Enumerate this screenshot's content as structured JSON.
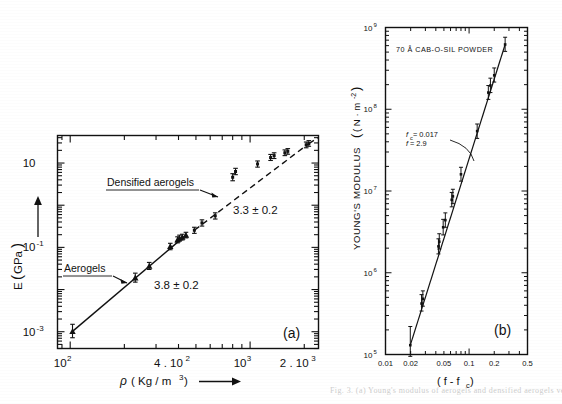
{
  "figure": {
    "background": "#ffffff",
    "ink": "#111111",
    "caption_fragment": "Fig. 3. (a) Young's modulus of aerogels and densified aerogels versus density; (b) Young's modulus of compacted"
  },
  "panel_a": {
    "tag": "(a)",
    "xlabel_parts": {
      "symbol": "ρ",
      "units": "( Kg / m",
      "exp": "3",
      "close": " )"
    },
    "xlabel_full": "ρ ( Kg / m³ )",
    "ylabel_parts": {
      "symbol": "E",
      "units": "( GPa )"
    },
    "ylabel_full": "E ( GPa )",
    "xticks": [
      {
        "value": 100,
        "label_mantissa": "10",
        "label_exp": "2"
      },
      {
        "value": 400,
        "label_mantissa": "4 . 10",
        "label_exp": "2"
      },
      {
        "value": 1000,
        "label_mantissa": "10",
        "label_exp": "3"
      },
      {
        "value": 2000,
        "label_mantissa": "2 . 10",
        "label_exp": "3"
      }
    ],
    "yticks": [
      {
        "value": 10,
        "label_mantissa": "10",
        "label_exp": ""
      },
      {
        "value": 0.1,
        "label_mantissa": "10",
        "label_exp": "-1"
      },
      {
        "value": 0.001,
        "label_mantissa": "10",
        "label_exp": "-3"
      }
    ],
    "annotations": [
      {
        "name": "aerogels-label",
        "text": "Aerogels",
        "underlined": true
      },
      {
        "name": "densified-label",
        "text": "Densified  aerogels",
        "underlined": true
      },
      {
        "name": "exponent-low",
        "text": "3.8 ± 0.2"
      },
      {
        "name": "exponent-high",
        "text": "3.3 ± 0.2"
      }
    ],
    "xlim": [
      85,
      2400
    ],
    "ylim": [
      0.0004,
      45
    ],
    "series": [
      {
        "name": "Aerogels",
        "marker": "filled-triangle",
        "line": "solid",
        "points": [
          {
            "x": 103,
            "y": 0.00102,
            "err_lo": 0.00072,
            "err_hi": 0.0015
          },
          {
            "x": 230,
            "y": 0.019,
            "err_lo": 0.015,
            "err_hi": 0.0245
          },
          {
            "x": 275,
            "y": 0.036,
            "err_lo": 0.03,
            "err_hi": 0.044
          },
          {
            "x": 360,
            "y": 0.105,
            "err_lo": 0.088,
            "err_hi": 0.125
          },
          {
            "x": 395,
            "y": 0.15,
            "err_lo": 0.128,
            "err_hi": 0.178
          },
          {
            "x": 405,
            "y": 0.165,
            "err_lo": 0.14,
            "err_hi": 0.195
          },
          {
            "x": 420,
            "y": 0.175,
            "err_lo": 0.15,
            "err_hi": 0.205
          },
          {
            "x": 440,
            "y": 0.195,
            "err_lo": 0.168,
            "err_hi": 0.228
          }
        ]
      },
      {
        "name": "Densified aerogels",
        "marker": "bar",
        "line": "dashed",
        "points": [
          {
            "x": 490,
            "y": 0.255,
            "err_lo": 0.215,
            "err_hi": 0.3
          },
          {
            "x": 540,
            "y": 0.38,
            "err_lo": 0.32,
            "err_hi": 0.45
          },
          {
            "x": 640,
            "y": 0.56,
            "err_lo": 0.47,
            "err_hi": 0.66
          },
          {
            "x": 800,
            "y": 4.6,
            "err_lo": 3.8,
            "err_hi": 5.6
          },
          {
            "x": 830,
            "y": 6.3,
            "err_lo": 5.3,
            "err_hi": 7.5
          },
          {
            "x": 1100,
            "y": 9.5,
            "err_lo": 8.0,
            "err_hi": 11.2
          },
          {
            "x": 1300,
            "y": 13.5,
            "err_lo": 11.5,
            "err_hi": 16.0
          },
          {
            "x": 1360,
            "y": 15.0,
            "err_lo": 12.8,
            "err_hi": 17.5
          },
          {
            "x": 1560,
            "y": 17.5,
            "err_lo": 15.0,
            "err_hi": 20.5
          },
          {
            "x": 1620,
            "y": 19.0,
            "err_lo": 16.2,
            "err_hi": 22.0
          },
          {
            "x": 2050,
            "y": 27.0,
            "err_lo": 23.0,
            "err_hi": 31.5
          },
          {
            "x": 2120,
            "y": 29.0,
            "err_lo": 25.0,
            "err_hi": 34.0
          }
        ]
      }
    ]
  },
  "panel_b": {
    "tag": "(b)",
    "title": "70 Å  CAB-O-SIL  POWDER",
    "ylabel_parts": {
      "main": "YOUNG'S MODULUS",
      "units": "( N · m",
      "exp": "-2",
      "close": " )"
    },
    "ylabel_full": "YOUNG'S MODULUS  ( N · m⁻² )",
    "xlabel_parts": {
      "open": "( f - f",
      "sub": "c",
      "close": " )"
    },
    "xlabel_full": "( f - f_c )",
    "fit": {
      "line1_lead": "f",
      "line1_sub": "c",
      "line1_rest": " = 0.017",
      "line2_lead": "f",
      "line2_rest": " = 2.9"
    },
    "xticks": [
      {
        "value": 0.01,
        "label": "0.01"
      },
      {
        "value": 0.02,
        "label": "0.02"
      },
      {
        "value": 0.05,
        "label": "0.05"
      },
      {
        "value": 0.1,
        "label": "0.1"
      },
      {
        "value": 0.2,
        "label": "0.2"
      },
      {
        "value": 0.5,
        "label": "0.5"
      }
    ],
    "yticks": [
      {
        "value": 1000000000.0,
        "label_mantissa": "10",
        "label_exp": "9"
      },
      {
        "value": 100000000.0,
        "label_mantissa": "10",
        "label_exp": "8"
      },
      {
        "value": 10000000.0,
        "label_mantissa": "10",
        "label_exp": "7"
      },
      {
        "value": 1000000.0,
        "label_mantissa": "10",
        "label_exp": "6"
      },
      {
        "value": 100000.0,
        "label_mantissa": "10",
        "label_exp": "5"
      }
    ],
    "xlim": [
      0.01,
      0.5
    ],
    "ylim": [
      100000.0,
      1000000000.0
    ],
    "series": [
      {
        "name": "Cab-O-Sil powder",
        "marker": "bar",
        "line": "solid",
        "points": [
          {
            "x": 0.0198,
            "y": 130000.0,
            "err_lo": 95000.0,
            "err_hi": 220000.0
          },
          {
            "x": 0.027,
            "y": 420000.0,
            "err_lo": 340000.0,
            "err_hi": 540000.0
          },
          {
            "x": 0.028,
            "y": 480000.0,
            "err_lo": 390000.0,
            "err_hi": 600000.0
          },
          {
            "x": 0.043,
            "y": 2100000.0,
            "err_lo": 1700000.0,
            "err_hi": 2600000.0
          },
          {
            "x": 0.044,
            "y": 2400000.0,
            "err_lo": 1950000.0,
            "err_hi": 3000000.0
          },
          {
            "x": 0.049,
            "y": 3600000.0,
            "err_lo": 2900000.0,
            "err_hi": 4500000.0
          },
          {
            "x": 0.052,
            "y": 4400000.0,
            "err_lo": 3600000.0,
            "err_hi": 5400000.0
          },
          {
            "x": 0.062,
            "y": 7800000.0,
            "err_lo": 6400000.0,
            "err_hi": 9600000.0
          },
          {
            "x": 0.064,
            "y": 8600000.0,
            "err_lo": 7000000.0,
            "err_hi": 10500000.0
          },
          {
            "x": 0.08,
            "y": 16000000.0,
            "err_lo": 13200000.0,
            "err_hi": 19500000.0
          },
          {
            "x": 0.125,
            "y": 54000000.0,
            "err_lo": 44000000.0,
            "err_hi": 66000000.0
          },
          {
            "x": 0.17,
            "y": 160000000.0,
            "err_lo": 132000000.0,
            "err_hi": 195000000.0
          },
          {
            "x": 0.18,
            "y": 195000000.0,
            "err_lo": 160000000.0,
            "err_hi": 240000000.0
          },
          {
            "x": 0.2,
            "y": 260000000.0,
            "err_lo": 215000000.0,
            "err_hi": 320000000.0
          },
          {
            "x": 0.27,
            "y": 620000000.0,
            "err_lo": 510000000.0,
            "err_hi": 760000000.0
          }
        ]
      }
    ]
  }
}
